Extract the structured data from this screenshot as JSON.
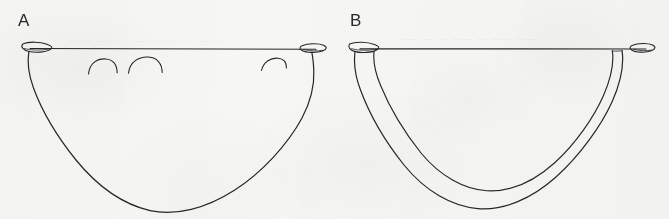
{
  "figure": {
    "kind": "line-drawing-figure",
    "medium": "scanned black ink line drawing on white paper",
    "background_color": "#f6f6f5",
    "ink_color": "#262626",
    "width": 669,
    "height": 219,
    "panel_count": 2
  },
  "panels": [
    {
      "id": "a",
      "label": "A",
      "description": "bowl profile outline with flat rim line, everted pointed lip tips at both ends, and three small arc notches below the rim",
      "rim_line_y": 48,
      "rim_left_x": 28,
      "rim_right_x": 317,
      "body_depth_y": 212,
      "arc_marks": 3
    },
    {
      "id": "b",
      "label": "B",
      "description": "bowl profile outline with flat rim line, everted pointed lip tips at both ends, and a double contour wall forming an inner and outer profile",
      "rim_line_y": 48,
      "rim_left_x": 352,
      "rim_right_x": 650,
      "body_depth_y": 209,
      "arc_marks": 0
    }
  ],
  "ghost_text": {
    "panel_a": "—  —   ——   —  ——   ——  — ——",
    "panel_b": "——  —   —  ——   — ——  ——"
  }
}
